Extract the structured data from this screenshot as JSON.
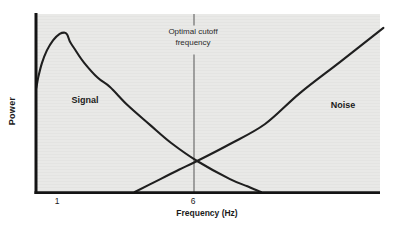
{
  "labels": {
    "power_axis": "Power",
    "x_axis": "Frequency (Hz)",
    "tick_1": "1",
    "tick_6": "6",
    "annotation_line1": "Optimal cutoff",
    "annotation_line2": "frequency",
    "signal": "Signal",
    "noise": "Noise"
  },
  "colors": {
    "plot_background": "#e8e8e6",
    "axis": "#141414",
    "curve": "#1f1f1f",
    "cutoff_line": "#6e6e6e",
    "text": "#1b1b1b"
  },
  "chart_data": {
    "type": "line",
    "title": "",
    "xlabel": "Frequency (Hz)",
    "ylabel": "Power",
    "xlim": [
      0.2,
      12.9
    ],
    "ylim": [
      0,
      1.05
    ],
    "x_ticks": [
      1,
      6
    ],
    "y_ticks": [],
    "grid": false,
    "legend": "inline-labels",
    "annotations": [
      {
        "text": "Optimal cutoff frequency",
        "type": "vertical-line",
        "x": 6
      }
    ],
    "series": [
      {
        "name": "Signal",
        "points": [
          [
            0.24,
            0.588
          ],
          [
            0.32,
            0.655
          ],
          [
            0.45,
            0.73
          ],
          [
            0.63,
            0.8
          ],
          [
            0.86,
            0.858
          ],
          [
            1.1,
            0.893
          ],
          [
            1.29,
            0.9
          ],
          [
            1.38,
            0.888
          ],
          [
            1.48,
            0.848
          ],
          [
            1.65,
            0.808
          ],
          [
            2.0,
            0.73
          ],
          [
            2.5,
            0.645
          ],
          [
            2.95,
            0.593
          ],
          [
            3.6,
            0.49
          ],
          [
            4.42,
            0.379
          ],
          [
            5.2,
            0.277
          ],
          [
            6.15,
            0.175
          ],
          [
            7.36,
            0.073
          ],
          [
            8.0,
            0.032
          ],
          [
            8.5,
            0.0
          ]
        ]
      },
      {
        "name": "Noise",
        "points": [
          [
            3.86,
            0.0
          ],
          [
            4.8,
            0.073
          ],
          [
            5.5,
            0.127
          ],
          [
            6.15,
            0.175
          ],
          [
            7.36,
            0.271
          ],
          [
            8.65,
            0.384
          ],
          [
            9.93,
            0.559
          ],
          [
            11.4,
            0.734
          ],
          [
            13.0,
            0.927
          ]
        ]
      }
    ]
  }
}
